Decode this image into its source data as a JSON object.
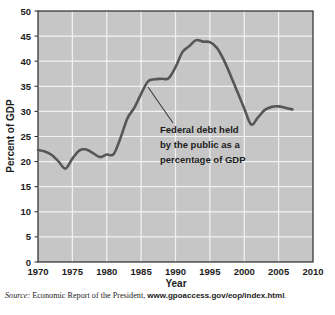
{
  "figure": {
    "plot_background_color": "#c6c6c6",
    "gridline_color": "#f2f2f2",
    "line_color": "#565656",
    "axis_color": "#2b2b2b"
  },
  "annotation": {
    "line1": "Federal debt held",
    "line2": "by the public as a",
    "line3": "percentage of GDP"
  },
  "source": {
    "label": "Source:",
    "text": " Economic Report of the President, ",
    "url": "www.gpoaccess.gov/eop/index.html",
    "period": "."
  },
  "chart_data": {
    "type": "line",
    "title": "",
    "xlabel": "Year",
    "ylabel": "Percent of GDP",
    "xlim": [
      1970,
      2010
    ],
    "ylim": [
      0,
      50
    ],
    "xticks": [
      1970,
      1975,
      1980,
      1985,
      1990,
      1995,
      2000,
      2005,
      2010
    ],
    "yticks": [
      0,
      5,
      10,
      15,
      20,
      25,
      30,
      35,
      40,
      45,
      50
    ],
    "grid": true,
    "legend": "none",
    "series": [
      {
        "name": "Federal debt held by the public as a percentage of GDP",
        "x": [
          1970,
          1971,
          1972,
          1973,
          1974,
          1975,
          1976,
          1977,
          1978,
          1979,
          1980,
          1981,
          1982,
          1983,
          1984,
          1985,
          1986,
          1987,
          1988,
          1989,
          1990,
          1991,
          1992,
          1993,
          1994,
          1995,
          1996,
          1997,
          1998,
          1999,
          2000,
          2001,
          2002,
          2003,
          2004,
          2005,
          2006,
          2007
        ],
        "values": [
          22.3,
          22.0,
          21.3,
          20.0,
          18.6,
          20.6,
          22.2,
          22.4,
          21.7,
          20.9,
          21.4,
          21.5,
          24.7,
          28.6,
          30.7,
          33.5,
          36.0,
          36.4,
          36.5,
          36.6,
          38.8,
          41.8,
          43.0,
          44.2,
          43.9,
          43.8,
          42.7,
          40.3,
          37.2,
          33.9,
          30.6,
          27.4,
          28.8,
          30.3,
          30.9,
          31.0,
          30.7,
          30.4
        ]
      }
    ]
  }
}
